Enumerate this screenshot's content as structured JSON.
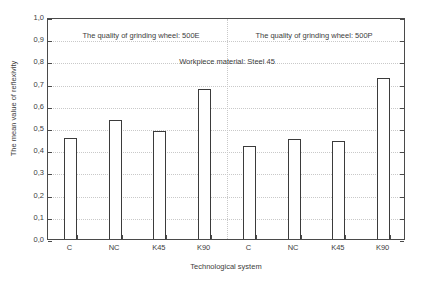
{
  "chart_data": {
    "type": "bar",
    "title": "",
    "xlabel": "Technological system",
    "ylabel": "The mean value of reflexivity",
    "categories": [
      "C",
      "NC",
      "K45",
      "K90",
      "C",
      "NC",
      "K45",
      "K90"
    ],
    "values": [
      0.455,
      0.535,
      0.485,
      0.675,
      0.42,
      0.45,
      0.44,
      0.725
    ],
    "ylim": [
      0.0,
      1.0
    ],
    "ytick_values": [
      0.0,
      0.1,
      0.2,
      0.3,
      0.4,
      0.5,
      0.6,
      0.7,
      0.8,
      0.9,
      1.0
    ],
    "ytick_labels": [
      "0,0",
      "0,1",
      "0,2",
      "0,3",
      "0,4",
      "0,5",
      "0,6",
      "0,7",
      "0,8",
      "0,9",
      "1,0"
    ],
    "grid": true,
    "legend": "none",
    "groups": [
      {
        "name": "500E",
        "categories": [
          "C",
          "NC",
          "K45",
          "K90"
        ],
        "values": [
          0.455,
          0.535,
          0.485,
          0.675
        ]
      },
      {
        "name": "500P",
        "categories": [
          "C",
          "NC",
          "K45",
          "K90"
        ],
        "values": [
          0.42,
          0.45,
          0.44,
          0.725
        ]
      }
    ],
    "annotations": [
      {
        "id": "left",
        "text": "The quality of grinding wheel: 500E"
      },
      {
        "id": "right",
        "text": "The quality of grinding wheel: 500P"
      },
      {
        "id": "mid",
        "text": "Workpiece material: Steel 45"
      }
    ],
    "colors": {
      "bar_fill": "#ffffff",
      "bar_edge": "#3b3b3b",
      "grid": "#c9c9c9",
      "axis": "#4a4a4a",
      "text": "#3d3d3d",
      "background": "#ffffff"
    }
  },
  "axes": {
    "y_title": "The mean value of reflexivity",
    "x_title": "Technological system"
  },
  "annotations": {
    "left": "The quality of grinding wheel: 500E",
    "right": "The quality of grinding wheel: 500P",
    "mid": "Workpiece material: Steel 45"
  }
}
